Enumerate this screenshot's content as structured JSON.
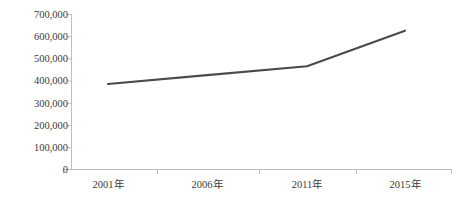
{
  "chart_data": {
    "type": "line",
    "title": "",
    "xlabel": "",
    "ylabel": "",
    "categories": [
      "2001年",
      "2006年",
      "2011年",
      "2015年"
    ],
    "series": [
      {
        "name": "",
        "values": [
          385000,
          425000,
          465000,
          625000
        ]
      }
    ],
    "ylim": [
      0,
      700000
    ],
    "ytick_labels": [
      "700,000",
      "600,000",
      "500,000",
      "400,000",
      "300,000",
      "200,000",
      "100,000",
      "0"
    ],
    "ytick_values": [
      700000,
      600000,
      500000,
      400000,
      300000,
      200000,
      100000,
      0
    ],
    "xtick_labels": [
      "2001年",
      "2006年",
      "2011年",
      "2015年"
    ],
    "grid": false,
    "legend": false,
    "legend_position": "none",
    "line_color": "#4a4a4a",
    "axis_color": "#bfbfbf",
    "text_color": "#3a3a3a",
    "markers": false
  },
  "axis": {
    "y_label_0": "700,000",
    "y_label_1": "600,000",
    "y_label_2": "500,000",
    "y_label_3": "400,000",
    "y_label_4": "300,000",
    "y_label_5": "200,000",
    "y_label_6": "100,000",
    "y_label_7": "0",
    "x_label_0": "2001年",
    "x_label_1": "2006年",
    "x_label_2": "2011年",
    "x_label_3": "2015年"
  }
}
